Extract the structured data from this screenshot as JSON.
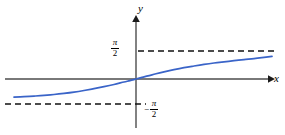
{
  "figure": {
    "background_color": "#ffffff",
    "width": 285,
    "height": 135
  },
  "axes": {
    "x_axis_label": "x",
    "y_axis_label": "y",
    "axis_color": "#4d4d4d",
    "origin_px": {
      "x": 136,
      "y": 79
    }
  },
  "labels": {
    "upper_asymptote": {
      "sign": "",
      "numerator": "π",
      "denominator": "2"
    },
    "lower_asymptote": {
      "sign": "−",
      "numerator": "π",
      "denominator": "2"
    }
  },
  "asymptotes": {
    "color": "#000000",
    "style": "dashed",
    "upper_value_px_y": 51,
    "lower_value_px_y": 104
  },
  "chart_data": {
    "type": "line",
    "title": "",
    "xlabel": "x",
    "ylabel": "y",
    "grid": false,
    "legend": null,
    "curve_color": "#3a64c8",
    "series": [
      {
        "name": "y = arctan x",
        "points_px": [
          [
            14,
            97.2
          ],
          [
            24,
            96.7
          ],
          [
            34,
            96.1
          ],
          [
            44,
            95.4
          ],
          [
            54,
            94.5
          ],
          [
            64,
            93.4
          ],
          [
            74,
            92.1
          ],
          [
            84,
            90.5
          ],
          [
            94,
            88.7
          ],
          [
            104,
            86.7
          ],
          [
            114,
            84.5
          ],
          [
            124,
            82.0
          ],
          [
            130,
            80.6
          ],
          [
            136,
            79.0
          ],
          [
            142,
            77.4
          ],
          [
            148,
            75.9
          ],
          [
            156,
            73.8
          ],
          [
            164,
            71.9
          ],
          [
            174,
            69.7
          ],
          [
            184,
            67.7
          ],
          [
            194,
            66.0
          ],
          [
            204,
            64.4
          ],
          [
            214,
            63.0
          ],
          [
            224,
            61.8
          ],
          [
            234,
            60.7
          ],
          [
            244,
            59.6
          ],
          [
            254,
            58.6
          ],
          [
            264,
            57.4
          ],
          [
            272,
            56.4
          ]
        ]
      }
    ],
    "asymptote_lines": [
      {
        "label": "π/2",
        "y_value": 1.5708,
        "y_px": 51,
        "x_start_px": 138,
        "x_end_px": 278
      },
      {
        "label": "−π/2",
        "y_value": -1.5708,
        "y_px": 104,
        "x_start_px": 5,
        "x_end_px": 146
      }
    ],
    "annotations": [
      {
        "text": "π/2",
        "at_px": [
          118,
          43
        ]
      },
      {
        "text": "−π/2",
        "at_px": [
          152,
          107
        ]
      },
      {
        "text": "y",
        "at_px": [
          140,
          8
        ]
      },
      {
        "text": "x",
        "at_px": [
          276,
          78
        ]
      }
    ]
  }
}
